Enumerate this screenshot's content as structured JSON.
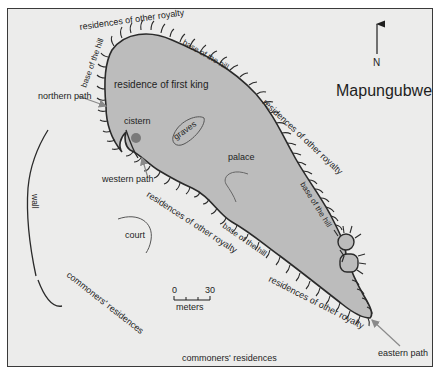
{
  "map": {
    "title": "Mapungubwe",
    "north_label": "N",
    "colors": {
      "background": "#ececeb",
      "hill_fill": "#bcbcbc",
      "outline": "#2a2a2a",
      "cistern": "#7a7a7a",
      "annotation_line": "#8a8a8a"
    },
    "labels": {
      "residence_first_king": "residence of first king",
      "cistern": "cistern",
      "graves": "graves",
      "palace": "palace",
      "court": "court",
      "wall": "wall",
      "northern_path": "northern path",
      "western_path": "western path",
      "eastern_path": "eastern path",
      "royalty_top": "residences of other royalty",
      "royalty_right": "residences of other royalty",
      "royalty_middle": "residences of other royalty",
      "royalty_bottom": "residences of other royalty",
      "base_left": "base of the hill",
      "base_top": "base of the hill",
      "base_right": "base of the hill",
      "base_bottom": "base of the hill",
      "commoners_left": "commoners' residences",
      "commoners_bottom": "commoners' residences"
    },
    "scale_bar": {
      "min_label": "0",
      "max_label": "30",
      "unit_label": "meters"
    }
  }
}
